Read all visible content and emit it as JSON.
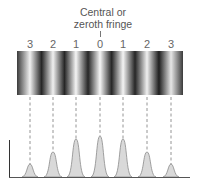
{
  "caption": {
    "line1": "Central or",
    "line2": "zeroth fringe"
  },
  "orders": [
    {
      "label": "3",
      "x": 30,
      "peak_top": 164
    },
    {
      "label": "2",
      "x": 53,
      "peak_top": 152
    },
    {
      "label": "1",
      "x": 76,
      "peak_top": 139
    },
    {
      "label": "0",
      "x": 100,
      "peak_top": 136
    },
    {
      "label": "1",
      "x": 123,
      "peak_top": 139
    },
    {
      "label": "2",
      "x": 147,
      "peak_top": 152
    },
    {
      "label": "3",
      "x": 171,
      "peak_top": 164
    }
  ],
  "colors": {
    "peak_fill": "#d9d9d9",
    "peak_stroke": "#8a8a8a",
    "dark_fringe": "#2b2b2b",
    "bright_fringe": "#f2f2f2"
  }
}
